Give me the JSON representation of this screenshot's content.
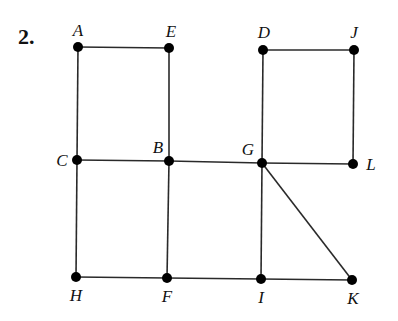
{
  "problem": {
    "number": "2."
  },
  "graph": {
    "nodes": [
      {
        "id": "A",
        "label": "A",
        "x": 78,
        "y": 47,
        "lx": 78,
        "ly": 36,
        "anchor": "middle"
      },
      {
        "id": "E",
        "label": "E",
        "x": 169,
        "y": 48,
        "lx": 171,
        "ly": 37,
        "anchor": "middle"
      },
      {
        "id": "D",
        "label": "D",
        "x": 263,
        "y": 50,
        "lx": 264,
        "ly": 38,
        "anchor": "middle"
      },
      {
        "id": "J",
        "label": "J",
        "x": 354,
        "y": 50,
        "lx": 354,
        "ly": 38,
        "anchor": "middle"
      },
      {
        "id": "C",
        "label": "C",
        "x": 77,
        "y": 160,
        "lx": 62,
        "ly": 166,
        "anchor": "middle"
      },
      {
        "id": "B",
        "label": "B",
        "x": 169,
        "y": 161,
        "lx": 158,
        "ly": 153,
        "anchor": "middle"
      },
      {
        "id": "G",
        "label": "G",
        "x": 262,
        "y": 163,
        "lx": 248,
        "ly": 155,
        "anchor": "middle"
      },
      {
        "id": "L",
        "label": "L",
        "x": 353,
        "y": 164,
        "lx": 371,
        "ly": 170,
        "anchor": "middle"
      },
      {
        "id": "H",
        "label": "H",
        "x": 76,
        "y": 277,
        "lx": 76,
        "ly": 301,
        "anchor": "middle"
      },
      {
        "id": "F",
        "label": "F",
        "x": 167,
        "y": 278,
        "lx": 167,
        "ly": 302,
        "anchor": "middle"
      },
      {
        "id": "I",
        "label": "I",
        "x": 261,
        "y": 279,
        "lx": 261,
        "ly": 303,
        "anchor": "middle"
      },
      {
        "id": "K",
        "label": "K",
        "x": 352,
        "y": 280,
        "lx": 353,
        "ly": 304,
        "anchor": "middle"
      }
    ],
    "edges": [
      [
        "A",
        "E"
      ],
      [
        "A",
        "C"
      ],
      [
        "E",
        "B"
      ],
      [
        "D",
        "J"
      ],
      [
        "D",
        "G"
      ],
      [
        "J",
        "L"
      ],
      [
        "C",
        "B"
      ],
      [
        "B",
        "G"
      ],
      [
        "G",
        "L"
      ],
      [
        "C",
        "H"
      ],
      [
        "B",
        "F"
      ],
      [
        "G",
        "I"
      ],
      [
        "G",
        "K"
      ],
      [
        "H",
        "F"
      ],
      [
        "F",
        "I"
      ],
      [
        "I",
        "K"
      ]
    ],
    "colors": {
      "edge": "#2a2a2a",
      "node": "#000000",
      "text": "#111111"
    }
  }
}
